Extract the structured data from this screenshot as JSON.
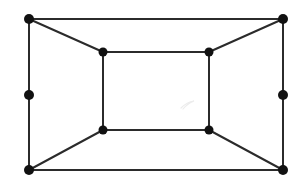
{
  "figure": {
    "background_color": "#ffffff",
    "width": 302,
    "height": 186
  },
  "chart_data": {
    "type": "diagram",
    "subtype": "undirected-graph-node-link",
    "xlabel": "",
    "ylabel": "",
    "grid": false,
    "legend": null,
    "axis_ranges": {
      "x": [
        0,
        302
      ],
      "y": [
        0,
        186
      ]
    },
    "style": {
      "edge_color": "#2b2b2b",
      "edge_width": 2,
      "vertex_color": "#111111",
      "background": "#ffffff"
    },
    "node_count": 10,
    "edge_count": 13,
    "nodes": [
      {
        "id": "outer-top-left",
        "label": "",
        "x": 29,
        "y": 19,
        "r": 5.0
      },
      {
        "id": "outer-top-right",
        "label": "",
        "x": 283,
        "y": 19,
        "r": 5.0
      },
      {
        "id": "outer-mid-left",
        "label": "",
        "x": 29,
        "y": 95,
        "r": 5.0
      },
      {
        "id": "outer-mid-right",
        "label": "",
        "x": 283,
        "y": 95,
        "r": 5.0
      },
      {
        "id": "outer-bottom-left",
        "label": "",
        "x": 29,
        "y": 170,
        "r": 5.0
      },
      {
        "id": "outer-bottom-right",
        "label": "",
        "x": 283,
        "y": 170,
        "r": 5.0
      },
      {
        "id": "inner-top-left",
        "label": "",
        "x": 103,
        "y": 52,
        "r": 4.5
      },
      {
        "id": "inner-top-right",
        "label": "",
        "x": 209,
        "y": 52,
        "r": 4.5
      },
      {
        "id": "inner-bottom-left",
        "label": "",
        "x": 103,
        "y": 130,
        "r": 4.5
      },
      {
        "id": "inner-bottom-right",
        "label": "",
        "x": 209,
        "y": 130,
        "r": 4.5
      }
    ],
    "edges": [
      {
        "id": "e-outer-top",
        "from": "outer-top-left",
        "to": "outer-top-right"
      },
      {
        "id": "e-outer-bottom",
        "from": "outer-bottom-left",
        "to": "outer-bottom-right"
      },
      {
        "id": "e-outer-left-upper",
        "from": "outer-top-left",
        "to": "outer-mid-left"
      },
      {
        "id": "e-outer-left-lower",
        "from": "outer-mid-left",
        "to": "outer-bottom-left"
      },
      {
        "id": "e-outer-right-upper",
        "from": "outer-top-right",
        "to": "outer-mid-right"
      },
      {
        "id": "e-outer-right-lower",
        "from": "outer-mid-right",
        "to": "outer-bottom-right"
      },
      {
        "id": "e-inner-top",
        "from": "inner-top-left",
        "to": "inner-top-right"
      },
      {
        "id": "e-inner-bottom",
        "from": "inner-bottom-left",
        "to": "inner-bottom-right"
      },
      {
        "id": "e-inner-left",
        "from": "inner-top-left",
        "to": "inner-bottom-left"
      },
      {
        "id": "e-inner-right",
        "from": "inner-top-right",
        "to": "inner-bottom-right"
      },
      {
        "id": "e-diag-top-left",
        "from": "outer-top-left",
        "to": "inner-top-left"
      },
      {
        "id": "e-diag-top-right",
        "from": "outer-top-right",
        "to": "inner-top-right"
      },
      {
        "id": "e-diag-bottom-left",
        "from": "outer-bottom-left",
        "to": "inner-bottom-left"
      },
      {
        "id": "e-diag-bottom-right",
        "from": "outer-bottom-right",
        "to": "inner-bottom-right"
      }
    ],
    "artifacts": [
      {
        "id": "scan-smudge",
        "x": 186,
        "y": 103,
        "note": "faint scan mark"
      }
    ]
  }
}
